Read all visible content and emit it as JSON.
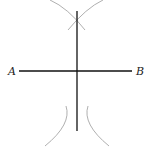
{
  "diagram": {
    "title": "",
    "type": "perpendicular-bisector-construction",
    "points": {
      "A": {
        "label": "A"
      },
      "B": {
        "label": "B"
      }
    },
    "colors": {
      "segment": "#111111",
      "bisector": "#111111",
      "arcs": "#9a9a9a",
      "labels": "#222222",
      "background": "#ffffff"
    }
  }
}
